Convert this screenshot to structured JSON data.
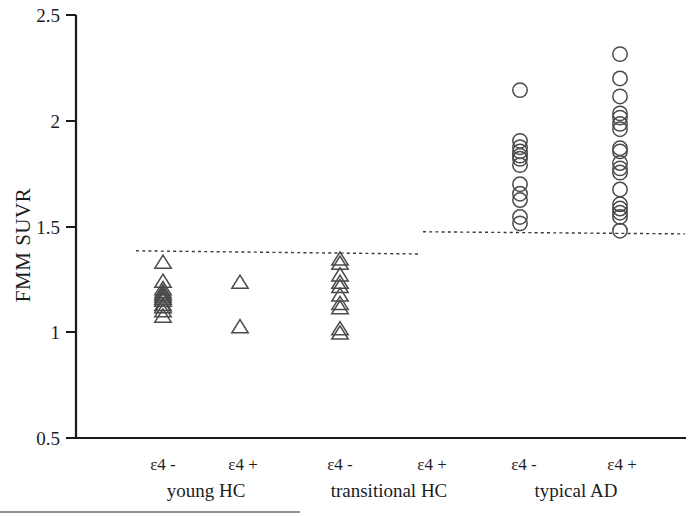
{
  "chart_data": {
    "type": "scatter",
    "title": "",
    "xlabel": "",
    "ylabel": "FMM SUVR",
    "ylim": [
      0.5,
      2.5
    ],
    "ytick_labels": [
      "0.5",
      "1",
      "1.5",
      "2",
      "2.5"
    ],
    "ytick_values": [
      0.5,
      1,
      1.5,
      2,
      2.5
    ],
    "grid": false,
    "legend": "none",
    "marker_shapes": {
      "triangle": "open-triangle",
      "circle": "open-circle"
    },
    "group_headers": [
      {
        "name": "young HC",
        "x_center": 205
      },
      {
        "name": "transitional HC",
        "x_center": 393
      },
      {
        "name": "typical AD",
        "x_center": 578
      }
    ],
    "categories": [
      {
        "label": "ε4 -",
        "group": "young HC",
        "x": 163,
        "marker": "triangle",
        "values": [
          1.33,
          1.24,
          1.205,
          1.19,
          1.18,
          1.17,
          1.16,
          1.15,
          1.13,
          1.12,
          1.1,
          1.075
        ]
      },
      {
        "label": "ε4 +",
        "group": "young HC",
        "x": 240,
        "marker": "triangle",
        "values": [
          1.235,
          1.025
        ]
      },
      {
        "label": "ε4 -",
        "group": "transitional HC",
        "x": 340,
        "marker": "triangle",
        "values": [
          1.345,
          1.325,
          1.27,
          1.235,
          1.215,
          1.175,
          1.135,
          1.115,
          1.015,
          0.995
        ]
      },
      {
        "label": "ε4 +",
        "group": "transitional HC",
        "x": 432,
        "marker": "triangle",
        "values": []
      },
      {
        "label": "ε4 -",
        "group": "typical AD",
        "x": 520,
        "marker": "circle",
        "values": [
          2.145,
          1.905,
          1.875,
          1.855,
          1.835,
          1.82,
          1.79,
          1.7,
          1.655,
          1.625,
          1.545,
          1.515
        ]
      },
      {
        "label": "ε4 +",
        "group": "typical AD",
        "x": 620,
        "marker": "circle",
        "values": [
          2.315,
          2.2,
          2.115,
          2.035,
          2.015,
          1.985,
          1.96,
          1.87,
          1.855,
          1.8,
          1.775,
          1.755,
          1.675,
          1.605,
          1.585,
          1.565,
          1.545,
          1.48
        ]
      }
    ],
    "reference_lines": [
      {
        "name": "HC cutoff",
        "x_start": 136,
        "x_end": 420,
        "y_start": 1.385,
        "y_end": 1.37,
        "style": "dashed"
      },
      {
        "name": "AD cutoff",
        "x_start": 423,
        "x_end": 685,
        "y_start": 1.475,
        "y_end": 1.465,
        "style": "dashed"
      }
    ]
  },
  "axis": {
    "y_title": "FMM SUVR",
    "y_ticks": [
      "2.5",
      "2",
      "1.5",
      "1",
      "0.5"
    ]
  },
  "xlabels": {
    "g1a": "ε4 -",
    "g1b": "ε4 +",
    "g2a": "ε4 -",
    "g2b": "ε4 +",
    "g3a": "ε4 -",
    "g3b": "ε4 +",
    "n1": "young HC",
    "n2": "transitional HC",
    "n3": "typical AD"
  },
  "colors": {
    "axis": "#1a1a1a",
    "marker": "#4a4a4a",
    "refline": "#3a3a3a",
    "background": "#ffffff"
  }
}
